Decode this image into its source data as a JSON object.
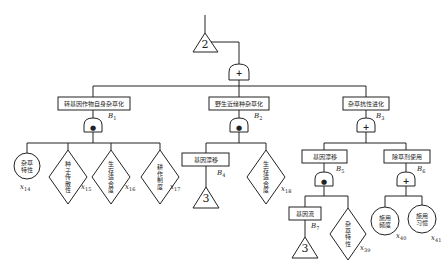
{
  "diagram": {
    "type": "fault-tree",
    "top": {
      "transfer_label": "2",
      "gate": "OR",
      "gate_symbol": "+"
    },
    "events": {
      "B1": {
        "label": "转基因作物自身杂草化",
        "id_letter": "B",
        "id_num": "1",
        "gate": "AND",
        "gate_symbol": "●"
      },
      "B2": {
        "label": "野生近缘种杂草化",
        "id_letter": "B",
        "id_num": "2",
        "gate": "AND",
        "gate_symbol": "●"
      },
      "B3": {
        "label": "杂草抗性进化",
        "id_letter": "B",
        "id_num": "3",
        "gate": "OR",
        "gate_symbol": "+"
      },
      "B4": {
        "label": "基因漂移",
        "id_letter": "B",
        "id_num": "4",
        "transfer_label": "3"
      },
      "B5": {
        "label": "基因漂移",
        "id_letter": "B",
        "id_num": "5",
        "gate": "AND",
        "gate_symbol": "●"
      },
      "B6": {
        "label": "除草剂使用",
        "id_letter": "B",
        "id_num": "6",
        "gate": "OR",
        "gate_symbol": "+"
      },
      "B7": {
        "label": "基因流",
        "id_letter": "B",
        "id_num": "7",
        "transfer_label": "3"
      }
    },
    "basic_events": {
      "x14": {
        "label": "杂草特性",
        "shape": "circle",
        "id_letter": "x",
        "id_num": "14"
      },
      "x15": {
        "label": "种子传散性",
        "shape": "diamond",
        "id_letter": "x",
        "id_num": "15"
      },
      "x16": {
        "label": "生存适合度",
        "shape": "diamond",
        "id_letter": "x",
        "id_num": "16"
      },
      "x17": {
        "label": "耕作制度",
        "shape": "diamond",
        "id_letter": "x",
        "id_num": "17"
      },
      "x18": {
        "label": "生存适合度",
        "shape": "diamond",
        "id_letter": "x",
        "id_num": "18"
      },
      "x39": {
        "label": "杂草特性",
        "shape": "diamond",
        "id_letter": "x",
        "id_num": "39"
      },
      "x40": {
        "label": "施用频度",
        "shape": "circle",
        "id_letter": "x",
        "id_num": "40"
      },
      "x41": {
        "label": "施用习惯",
        "shape": "circle",
        "id_letter": "x",
        "id_num": "41"
      }
    }
  }
}
